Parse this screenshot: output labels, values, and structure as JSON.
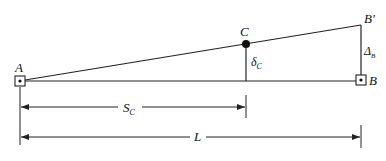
{
  "diagram": {
    "type": "beam-deflection-geometry",
    "points": {
      "A": {
        "label": "A"
      },
      "B": {
        "label": "B"
      },
      "B_prime": {
        "label": "B'"
      },
      "C": {
        "label": "C"
      }
    },
    "labels": {
      "delta_c_main": "δ",
      "delta_c_sub": "C",
      "Delta_b_main": "Δ",
      "Delta_b_sub": "B",
      "S_c_main": "S",
      "S_c_sub": "C",
      "L": "L"
    },
    "colors": {
      "line": "#222222",
      "background": "#ffffff"
    }
  }
}
